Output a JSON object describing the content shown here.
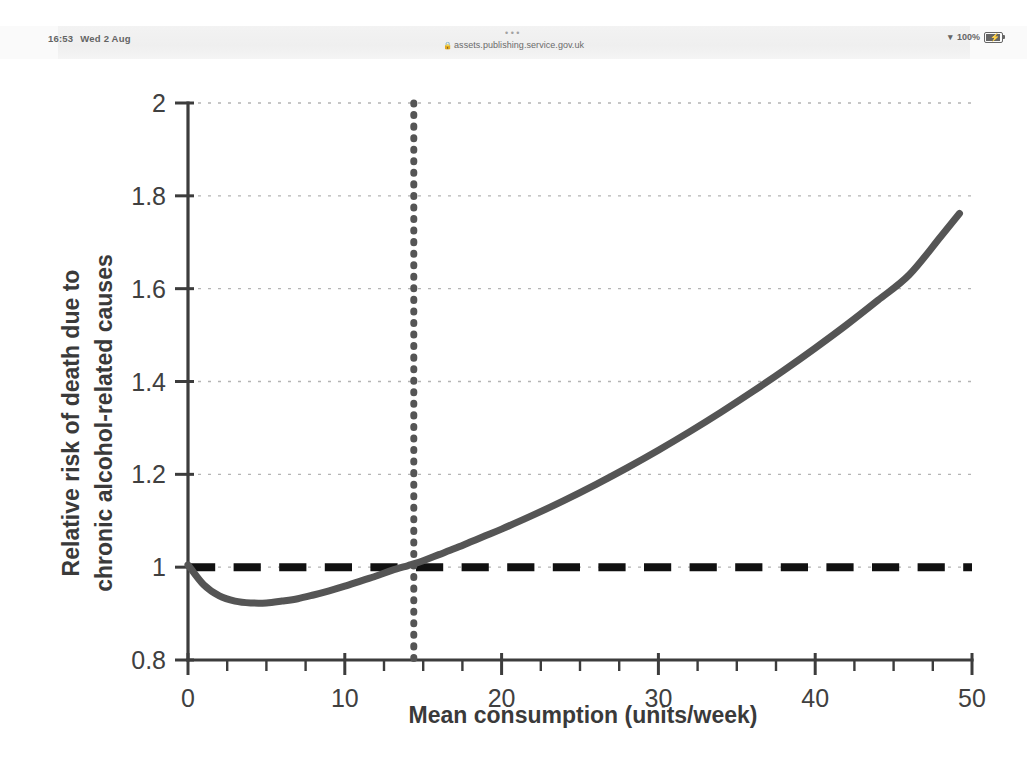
{
  "status_bar": {
    "time": "16:53",
    "date": "Wed 2 Aug",
    "tab_dots": "•••",
    "lock_icon": "lock-icon",
    "url": "assets.publishing.service.gov.uk",
    "wifi_icon": "wifi-icon",
    "battery_percent": "100%",
    "battery_icon": "battery-charging-icon"
  },
  "chart_data": {
    "type": "line",
    "title": "",
    "xlabel": "Mean consumption (units/week)",
    "ylabel": "Relative risk of death due to chronic alcohol-related causes",
    "ylabel_line1": "Relative risk of death due to",
    "ylabel_line2": "chronic alcohol-related causes",
    "xlim": [
      0,
      50
    ],
    "ylim": [
      0.8,
      2
    ],
    "xticks": [
      0,
      10,
      20,
      30,
      40,
      50
    ],
    "xtick_labels": [
      "0",
      "10",
      "20",
      "30",
      "40",
      "50"
    ],
    "x_minor_tick_step": 2.5,
    "yticks": [
      0.8,
      1,
      1.2,
      1.4,
      1.6,
      1.8,
      2
    ],
    "ytick_labels": [
      "0.8",
      "1",
      "1.2",
      "1.4",
      "1.6",
      "1.8",
      "2"
    ],
    "grid": "horizontal-dotted-major",
    "legend": "none",
    "series": [
      {
        "name": "Relative risk curve",
        "style": "solid",
        "color": "#555555",
        "width": 7,
        "x": [
          0,
          1,
          2,
          3,
          4,
          5,
          6,
          7,
          8,
          9,
          10,
          11,
          12,
          13,
          14,
          14.5,
          15,
          16,
          17,
          18,
          19,
          20,
          22,
          24,
          26,
          28,
          30,
          32,
          34,
          36,
          38,
          40,
          42,
          44,
          46,
          48,
          49.2
        ],
        "y": [
          1.005,
          0.962,
          0.938,
          0.927,
          0.923,
          0.923,
          0.927,
          0.932,
          0.94,
          0.949,
          0.959,
          0.97,
          0.981,
          0.993,
          1.003,
          1.008,
          1.014,
          1.027,
          1.04,
          1.054,
          1.068,
          1.082,
          1.112,
          1.144,
          1.178,
          1.214,
          1.252,
          1.292,
          1.334,
          1.378,
          1.424,
          1.472,
          1.522,
          1.575,
          1.63,
          1.712,
          1.762
        ]
      }
    ],
    "reference_lines": [
      {
        "name": "relative-risk-unity-line",
        "orientation": "horizontal",
        "value": 1,
        "style": "dashed",
        "color": "#111111",
        "width": 8
      },
      {
        "name": "threshold-consumption-line",
        "orientation": "vertical",
        "value": 14.4,
        "style": "dotted",
        "color": "#555555",
        "width": 7
      }
    ]
  }
}
